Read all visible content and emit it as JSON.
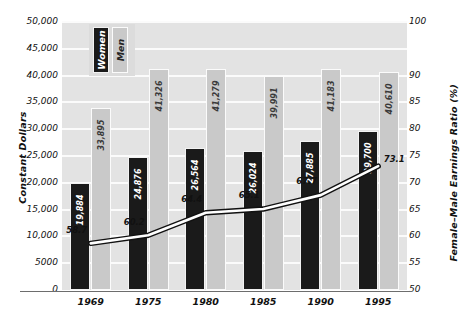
{
  "chart_data": {
    "type": "bar",
    "title": "",
    "subtitle": "",
    "xlabel": "",
    "ylabel": "Constant Dollars",
    "y2label": "Female–Male Earnings Ratio (%)",
    "categories": [
      "1969",
      "1975",
      "1980",
      "1985",
      "1990",
      "1995"
    ],
    "series": [
      {
        "name": "Women",
        "type": "bar",
        "axis": "left",
        "color": "#1a1a1a",
        "values": [
          19884,
          24876,
          26564,
          26024,
          27885,
          29700
        ],
        "labels": [
          "19,884",
          "24,876",
          "26,564",
          "26,024",
          "27,885",
          "29,700"
        ]
      },
      {
        "name": "Men",
        "type": "bar",
        "axis": "left",
        "color": "#c9c9c9",
        "values": [
          33895,
          41326,
          41279,
          39991,
          41183,
          40610
        ],
        "labels": [
          "33,895",
          "41,326",
          "41,279",
          "39,991",
          "41,183",
          "40,610"
        ]
      },
      {
        "name": "Female–Male Earnings Ratio",
        "type": "line",
        "axis": "right",
        "color": "#ffffff",
        "outline": "#111111",
        "values": [
          58.7,
          60.2,
          64.4,
          65.1,
          67.7,
          73.1
        ],
        "labels": [
          "58.7",
          "60.2",
          "64.4",
          "65.1",
          "67.7",
          "73.1"
        ]
      }
    ],
    "ylim": [
      0,
      50000
    ],
    "yticks": [
      0,
      5000,
      10000,
      15000,
      20000,
      25000,
      30000,
      35000,
      40000,
      45000,
      50000
    ],
    "ytick_labels": [
      "0",
      "5000",
      "10,000",
      "15,000",
      "20,000",
      "25,000",
      "30,000",
      "35,000",
      "40,000",
      "45,000",
      "50,000"
    ],
    "y2lim": [
      50,
      100
    ],
    "y2ticks": [
      50,
      55,
      60,
      65,
      70,
      75,
      80,
      85,
      90,
      100
    ],
    "y2tick_labels": [
      "50",
      "55",
      "60",
      "65",
      "70",
      "75",
      "80",
      "85",
      "90",
      "100"
    ],
    "grid": true,
    "grid_color": "#fbfbfb",
    "plot_background": "#e3e3e3",
    "legend": {
      "position": "top-left",
      "entries": [
        {
          "label": "Women",
          "color": "#1a1a1a",
          "text_color": "#ffffff"
        },
        {
          "label": "Men",
          "color": "#c9c9c9",
          "text_color": "#262626"
        }
      ]
    }
  }
}
